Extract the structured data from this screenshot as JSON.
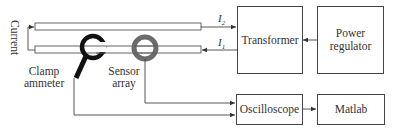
{
  "diagram": {
    "type": "block-diagram",
    "current_label": "Current",
    "clamp_label_line1": "Clamp",
    "clamp_label_line2": "ammeter",
    "sensor_label_line1": "Sensor",
    "sensor_label_line2": "array",
    "i2_label": "I",
    "i2_sub": "2",
    "i1_label": "I",
    "i1_sub": "1",
    "blocks": {
      "transformer": "Transformer",
      "power_line1": "Power",
      "power_line2": "regulator",
      "oscilloscope": "Oscilloscope",
      "matlab": "Matlab"
    },
    "colors": {
      "line": "#444444",
      "clamp": "#111111",
      "sensor": "#6b6b6b"
    },
    "connections": [
      {
        "from": "power-regulator",
        "to": "transformer"
      },
      {
        "from": "transformer",
        "to": "conductor",
        "label": "I2"
      },
      {
        "from": "conductor",
        "to": "transformer",
        "label": "I1"
      },
      {
        "from": "sensor-array",
        "to": "oscilloscope"
      },
      {
        "from": "clamp-ammeter",
        "to": "oscilloscope"
      },
      {
        "from": "oscilloscope",
        "to": "matlab"
      }
    ]
  }
}
